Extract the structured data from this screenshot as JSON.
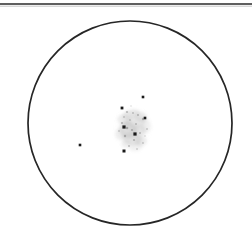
{
  "figure": {
    "width": 252,
    "height": 243,
    "background_color": "#ffffff"
  },
  "top_rule": {
    "name": "top-horizontal-rule",
    "x1": 0,
    "x2": 252,
    "y": 4,
    "stroke_color": "#2a2a2a",
    "stroke_width": 1.6
  },
  "field_circle": {
    "name": "field-of-view-circle",
    "center_x": 130,
    "center_y": 123,
    "radius": 102,
    "stroke_color": "#262626",
    "stroke_width": 1.7,
    "fill": "none"
  },
  "chart_data": {
    "type": "scatter",
    "title": "",
    "subtitle": "",
    "xlabel": "",
    "ylabel": "",
    "xlim": [
      28,
      232
    ],
    "ylim": [
      21,
      225
    ],
    "grid": false,
    "legend": "none",
    "axes_visible": false,
    "boundary": {
      "shape": "circle",
      "center": [
        130,
        123
      ],
      "radius": 102
    },
    "annotations": [],
    "series": [
      {
        "name": "point sources",
        "marker": "square",
        "color": "#1a1a1a",
        "points": [
          {
            "id": "p1",
            "x": 143,
            "y": 97,
            "size": 2.6
          },
          {
            "id": "p2",
            "x": 122,
            "y": 108,
            "size": 2.8
          },
          {
            "id": "p3",
            "x": 145,
            "y": 118,
            "size": 2.6
          },
          {
            "id": "p4",
            "x": 124,
            "y": 127,
            "size": 3.2
          },
          {
            "id": "p5",
            "x": 135,
            "y": 134,
            "size": 3.2
          },
          {
            "id": "p6",
            "x": 124,
            "y": 151,
            "size": 3.0
          },
          {
            "id": "p7",
            "x": 80,
            "y": 145,
            "size": 2.6
          }
        ]
      },
      {
        "name": "diffuse cluster",
        "marker": "cloud",
        "color": "#b8b8b8",
        "centroid": [
          133,
          128
        ],
        "extent_x": 34,
        "extent_y": 42,
        "blobs": [
          {
            "x": 131,
            "y": 114,
            "rx": 9,
            "ry": 4,
            "opacity": 0.34,
            "rot": -14
          },
          {
            "x": 141,
            "y": 117,
            "rx": 6,
            "ry": 5,
            "opacity": 0.3,
            "rot": 8
          },
          {
            "x": 124,
            "y": 120,
            "rx": 7,
            "ry": 5,
            "opacity": 0.26,
            "rot": 20
          },
          {
            "x": 135,
            "y": 122,
            "rx": 11,
            "ry": 6,
            "opacity": 0.22,
            "rot": -6
          },
          {
            "x": 128,
            "y": 130,
            "rx": 9,
            "ry": 8,
            "opacity": 0.38,
            "rot": 30
          },
          {
            "x": 139,
            "y": 131,
            "rx": 7,
            "ry": 6,
            "opacity": 0.28,
            "rot": -22
          },
          {
            "x": 132,
            "y": 139,
            "rx": 10,
            "ry": 6,
            "opacity": 0.34,
            "rot": 12
          },
          {
            "x": 141,
            "y": 141,
            "rx": 6,
            "ry": 5,
            "opacity": 0.26,
            "rot": 0
          },
          {
            "x": 126,
            "y": 144,
            "rx": 5,
            "ry": 4,
            "opacity": 0.22,
            "rot": 0
          },
          {
            "x": 136,
            "y": 147,
            "rx": 7,
            "ry": 4,
            "opacity": 0.2,
            "rot": -10
          },
          {
            "x": 120,
            "y": 134,
            "rx": 5,
            "ry": 6,
            "opacity": 0.24,
            "rot": 0
          },
          {
            "x": 146,
            "y": 126,
            "rx": 5,
            "ry": 7,
            "opacity": 0.2,
            "rot": 0
          }
        ],
        "speckles": [
          {
            "x": 127,
            "y": 112,
            "r": 1.1,
            "opacity": 0.5
          },
          {
            "x": 133,
            "y": 113,
            "r": 0.9,
            "opacity": 0.45
          },
          {
            "x": 138,
            "y": 115,
            "r": 1.0,
            "opacity": 0.5
          },
          {
            "x": 143,
            "y": 119,
            "r": 1.2,
            "opacity": 0.55
          },
          {
            "x": 130,
            "y": 120,
            "r": 0.9,
            "opacity": 0.4
          },
          {
            "x": 122,
            "y": 123,
            "r": 1.1,
            "opacity": 0.5
          },
          {
            "x": 136,
            "y": 124,
            "r": 1.0,
            "opacity": 0.45
          },
          {
            "x": 127,
            "y": 128,
            "r": 1.3,
            "opacity": 0.6
          },
          {
            "x": 132,
            "y": 130,
            "r": 1.1,
            "opacity": 0.55
          },
          {
            "x": 140,
            "y": 133,
            "r": 1.0,
            "opacity": 0.5
          },
          {
            "x": 125,
            "y": 136,
            "r": 1.2,
            "opacity": 0.55
          },
          {
            "x": 134,
            "y": 140,
            "r": 1.1,
            "opacity": 0.5
          },
          {
            "x": 143,
            "y": 143,
            "r": 0.9,
            "opacity": 0.4
          },
          {
            "x": 129,
            "y": 146,
            "r": 1.0,
            "opacity": 0.45
          },
          {
            "x": 137,
            "y": 149,
            "r": 0.9,
            "opacity": 0.35
          },
          {
            "x": 119,
            "y": 131,
            "r": 0.9,
            "opacity": 0.4
          },
          {
            "x": 147,
            "y": 129,
            "r": 0.9,
            "opacity": 0.4
          },
          {
            "x": 131,
            "y": 106,
            "r": 0.8,
            "opacity": 0.3
          },
          {
            "x": 124,
            "y": 117,
            "r": 0.9,
            "opacity": 0.4
          },
          {
            "x": 145,
            "y": 136,
            "r": 0.8,
            "opacity": 0.35
          }
        ]
      }
    ]
  }
}
